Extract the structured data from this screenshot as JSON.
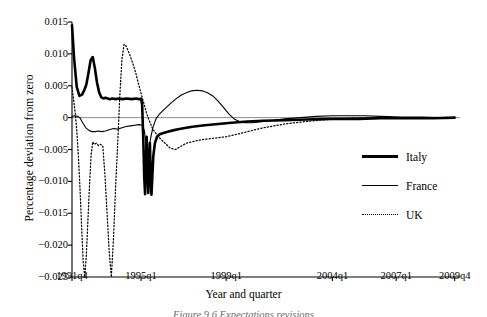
{
  "chart_data": {
    "type": "line",
    "title": "",
    "xlabel": "Year and quarter",
    "ylabel": "Percentage deviation from zero",
    "xlim": [
      0,
      73
    ],
    "ylim": [
      -0.025,
      0.015
    ],
    "grid": false,
    "zero_line": true,
    "legend_position": "right-middle",
    "xticks": [
      {
        "label": "1991q4",
        "value": 0
      },
      {
        "label": "1995q1",
        "value": 13
      },
      {
        "label": "1999q1",
        "value": 29
      },
      {
        "label": "2004q1",
        "value": 49
      },
      {
        "label": "2007q1",
        "value": 61
      },
      {
        "label": "2009q4",
        "value": 72
      }
    ],
    "yticks": [
      {
        "label": "0.015",
        "value": 0.015
      },
      {
        "label": "0.010",
        "value": 0.01
      },
      {
        "label": "0.005",
        "value": 0.005
      },
      {
        "label": "0",
        "value": 0
      },
      {
        "label": "−0.005",
        "value": -0.005
      },
      {
        "label": "−0.010",
        "value": -0.01
      },
      {
        "label": "−0.015",
        "value": -0.015
      },
      {
        "label": "−0.020",
        "value": -0.02
      },
      {
        "label": "−0.025",
        "value": -0.025
      }
    ],
    "series": [
      {
        "name": "Italy",
        "style": "thick-solid",
        "color": "#000000",
        "x": [
          0,
          0.4,
          0.9,
          1.4,
          1.9,
          2.3,
          2.7,
          3.1,
          3.5,
          3.9,
          4.3,
          4.7,
          5.1,
          5.5,
          5.9,
          6.3,
          6.7,
          7.1,
          7.6,
          8.2,
          8.8,
          9.5,
          10.3,
          11.2,
          12.1,
          12.6,
          13.0,
          13.2,
          13.4,
          13.6,
          13.75,
          13.9,
          14.05,
          14.2,
          14.35,
          14.5,
          14.65,
          14.8,
          14.95,
          15.1,
          15.3,
          15.6,
          16.0,
          16.5,
          17.2,
          18.0,
          19.0,
          20.2,
          21.5,
          23.0,
          25.0,
          27.5,
          30.0,
          33.0,
          36.0,
          40.0,
          44.0,
          49.0,
          54.0,
          58.0,
          61.0,
          65.0,
          68.0,
          72.0
        ],
        "y": [
          0.0145,
          0.0092,
          0.0048,
          0.0034,
          0.0036,
          0.0043,
          0.0052,
          0.007,
          0.009,
          0.0095,
          0.0078,
          0.0055,
          0.004,
          0.0032,
          0.003,
          0.0031,
          0.003,
          0.0029,
          0.003,
          0.0029,
          0.003,
          0.0029,
          0.003,
          0.0029,
          0.003,
          0.0029,
          0.003,
          0.002,
          -0.003,
          -0.0095,
          -0.012,
          -0.007,
          -0.003,
          -0.0075,
          -0.0118,
          -0.008,
          -0.004,
          -0.009,
          -0.0121,
          -0.0095,
          -0.006,
          -0.004,
          -0.003,
          -0.0026,
          -0.0024,
          -0.0022,
          -0.002,
          -0.0018,
          -0.0016,
          -0.0014,
          -0.0012,
          -0.001,
          -0.0008,
          -0.0006,
          -0.0005,
          -0.0004,
          -0.0003,
          -0.0002,
          -0.0002,
          -0.0001,
          -0.0001,
          -0.0001,
          -0.0001,
          0.0
        ]
      },
      {
        "name": "France",
        "style": "thin-solid",
        "color": "#000000",
        "x": [
          0,
          0.5,
          1.0,
          1.5,
          2.0,
          2.6,
          3.2,
          3.8,
          4.4,
          5.0,
          5.6,
          6.3,
          7.0,
          7.8,
          8.6,
          9.4,
          10.2,
          11.0,
          11.8,
          12.6,
          13.2,
          13.6,
          13.9,
          14.2,
          14.5,
          14.8,
          15.2,
          15.8,
          16.5,
          17.5,
          18.5,
          19.5,
          20.5,
          21.5,
          22.5,
          23.5,
          24.5,
          25.5,
          26.5,
          27.5,
          28.5,
          29.5,
          30.5,
          31.5,
          32.5,
          34.0,
          36.0,
          38.0,
          40.0,
          43.0,
          46.0,
          49.0,
          52.0,
          55.0,
          58.0,
          62.0,
          66.0,
          69.0,
          72.0
        ],
        "y": [
          0.0002,
          0.0003,
          0.0002,
          0.0,
          -0.0008,
          -0.0016,
          -0.002,
          -0.0022,
          -0.0022,
          -0.0021,
          -0.0022,
          -0.0021,
          -0.0019,
          -0.0017,
          -0.0018,
          -0.0016,
          -0.0014,
          -0.0013,
          -0.0012,
          -0.0011,
          -0.0012,
          -0.002,
          -0.0038,
          -0.0058,
          -0.005,
          -0.0032,
          -0.0016,
          -0.0002,
          0.0006,
          0.0014,
          0.0022,
          0.0029,
          0.0035,
          0.0039,
          0.0042,
          0.0043,
          0.0042,
          0.0039,
          0.0034,
          0.0026,
          0.0016,
          0.0006,
          -0.0002,
          -0.0006,
          -0.0008,
          -0.0008,
          -0.0006,
          -0.0004,
          -0.0002,
          0.0,
          0.0002,
          0.0003,
          0.0003,
          0.0003,
          0.0002,
          0.0001,
          0.0001,
          0.0,
          0.0
        ]
      },
      {
        "name": "UK",
        "style": "dotted",
        "color": "#000000",
        "x": [
          0,
          0.3,
          0.6,
          0.9,
          1.2,
          1.5,
          1.8,
          2.1,
          2.4,
          2.7,
          3.0,
          3.3,
          3.6,
          3.9,
          4.2,
          4.6,
          5.0,
          5.4,
          5.8,
          6.2,
          6.6,
          7.0,
          7.4,
          7.8,
          8.2,
          8.6,
          9.0,
          9.4,
          9.8,
          10.2,
          10.8,
          11.4,
          12.0,
          12.6,
          13.2,
          13.6,
          14.0,
          14.4,
          14.8,
          15.2,
          15.8,
          16.5,
          17.5,
          18.5,
          19.5,
          20.5,
          21.5,
          22.5,
          23.5,
          25.0,
          27.0,
          29.0,
          31.0,
          33.0,
          36.0,
          40.0,
          44.0,
          48.0,
          52.0,
          56.0,
          60.0,
          64.0,
          68.0,
          72.0
        ],
        "y": [
          0.0048,
          0.0028,
          0.0008,
          -0.002,
          -0.006,
          -0.011,
          -0.017,
          -0.0225,
          -0.025,
          -0.0215,
          -0.016,
          -0.0105,
          -0.0058,
          -0.0038,
          -0.0042,
          -0.004,
          -0.0044,
          -0.0042,
          -0.0045,
          -0.009,
          -0.015,
          -0.021,
          -0.025,
          -0.019,
          -0.011,
          -0.004,
          0.0035,
          0.0092,
          0.0115,
          0.0112,
          0.01,
          0.0086,
          0.007,
          0.005,
          0.0032,
          0.002,
          0.0008,
          -0.0002,
          -0.001,
          -0.0018,
          -0.0025,
          -0.0032,
          -0.004,
          -0.0048,
          -0.005,
          -0.0045,
          -0.004,
          -0.0038,
          -0.0036,
          -0.0034,
          -0.0032,
          -0.003,
          -0.0026,
          -0.0022,
          -0.0016,
          -0.001,
          -0.0006,
          -0.0003,
          -0.0001,
          0.0,
          0.0,
          0.0,
          0.0,
          0.0
        ]
      }
    ]
  },
  "legend": {
    "items": [
      {
        "label": "Italy",
        "style": "thick"
      },
      {
        "label": "France",
        "style": "thin"
      },
      {
        "label": "UK",
        "style": "dot"
      }
    ]
  },
  "caption": {
    "text": "Figure 9.6   Expectations revisions"
  }
}
